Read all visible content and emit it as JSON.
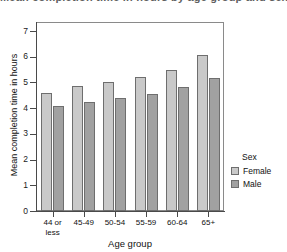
{
  "chart_data": {
    "type": "bar",
    "title": "Mean completion time in hours by age group and sex",
    "xlabel": "Age group",
    "ylabel": "Mean completion time in hours",
    "categories": [
      "44 or\nless",
      "45-49",
      "50-54",
      "55-59",
      "60-64",
      "65+"
    ],
    "series": [
      {
        "name": "Female",
        "color": "#c9c9c9",
        "values": [
          4.58,
          4.87,
          5.02,
          5.22,
          5.47,
          6.08
        ]
      },
      {
        "name": "Male",
        "color": "#a1a1a1",
        "values": [
          4.1,
          4.25,
          4.39,
          4.57,
          4.83,
          5.17
        ]
      }
    ],
    "ylim": [
      0,
      7.35
    ],
    "yticks": [
      0,
      1,
      2,
      3,
      4,
      5,
      6,
      7
    ],
    "ytick_labels": [
      "0",
      "1",
      "2",
      "3",
      "4",
      "5",
      "6",
      "7"
    ],
    "grid": false,
    "legend": {
      "title": "Sex",
      "position": "right",
      "entries": [
        "Female",
        "Male"
      ]
    }
  }
}
